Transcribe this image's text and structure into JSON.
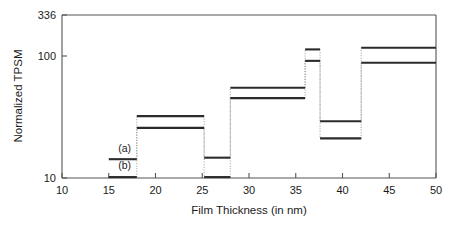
{
  "chart_data": {
    "type": "line",
    "subtype": "step",
    "title": "",
    "xlabel": "Film Thickness (in nm)",
    "ylabel": "Normalized TPSM",
    "xlim": [
      10,
      50
    ],
    "ylim": [
      10,
      336
    ],
    "yscale": "log",
    "xscale": "linear",
    "grid": false,
    "legend_position": "inline-annotations",
    "xticks": [
      10,
      15,
      20,
      25,
      30,
      35,
      40,
      45,
      50
    ],
    "xtick_labels": [
      "10",
      "15",
      "20",
      "25",
      "30",
      "35",
      "40",
      "45",
      "50"
    ],
    "yticks": [
      10,
      100,
      336
    ],
    "ytick_labels": [
      "10",
      "100",
      "336"
    ],
    "annotations": [
      {
        "text": "(a)",
        "x": 16.7,
        "y": 17.5
      },
      {
        "text": "(b)",
        "x": 16.7,
        "y": 12.2
      }
    ],
    "series": [
      {
        "name": "(a)",
        "label": "(a)",
        "color": "#2b2b2b",
        "steps": [
          {
            "x_start": 15.0,
            "x_end": 18.0,
            "value": 15.0
          },
          {
            "x_start": 18.0,
            "x_end": 25.2,
            "value": 38.0
          },
          {
            "x_start": 25.2,
            "x_end": 28.0,
            "value": 15.5
          },
          {
            "x_start": 28.0,
            "x_end": 36.0,
            "value": 70.0
          },
          {
            "x_start": 36.0,
            "x_end": 37.6,
            "value": 160.0
          },
          {
            "x_start": 37.6,
            "x_end": 42.0,
            "value": 34.0
          },
          {
            "x_start": 42.0,
            "x_end": 50.0,
            "value": 166.0
          }
        ]
      },
      {
        "name": "(b)",
        "label": "(b)",
        "color": "#2b2b2b",
        "steps": [
          {
            "x_start": 15.0,
            "x_end": 18.0,
            "value": 10.2
          },
          {
            "x_start": 18.0,
            "x_end": 25.2,
            "value": 29.5
          },
          {
            "x_start": 25.2,
            "x_end": 28.0,
            "value": 10.2
          },
          {
            "x_start": 28.0,
            "x_end": 36.0,
            "value": 56.0
          },
          {
            "x_start": 36.0,
            "x_end": 37.6,
            "value": 125.0
          },
          {
            "x_start": 37.6,
            "x_end": 42.0,
            "value": 23.5
          },
          {
            "x_start": 42.0,
            "x_end": 50.0,
            "value": 120.0
          }
        ]
      }
    ]
  },
  "axes": {
    "y_title": "Normalized TPSM",
    "x_title": "Film Thickness (in nm)",
    "y_top_label": "336",
    "y_mid_label": "100",
    "y_bottom_label": "10"
  }
}
